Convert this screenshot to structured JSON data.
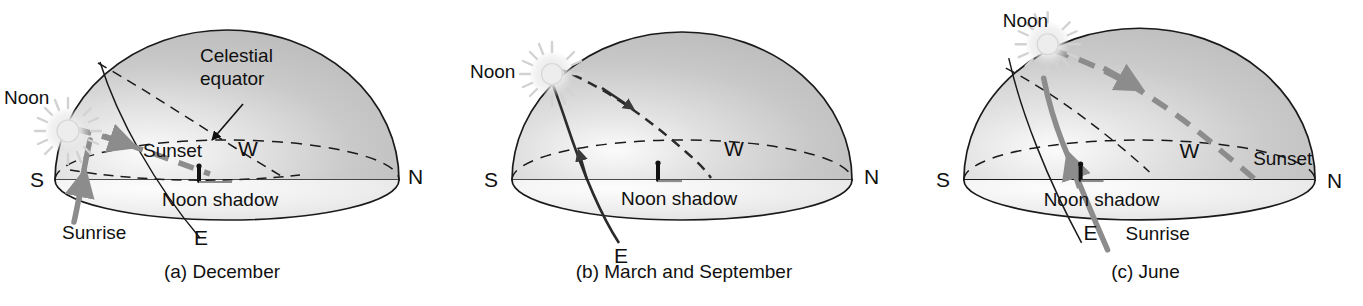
{
  "figure": {
    "colors": {
      "dome_fill_dark": "#c2c2c2",
      "dome_fill_light": "#f2f2f2",
      "outline": "#1a1a1a",
      "sun_path_gray": "#8c8c8c",
      "sun_glow": "#e8e8e8",
      "text": "#101010"
    }
  },
  "panels": [
    {
      "id": "december",
      "caption": "(a) December",
      "cardinals": {
        "south": "S",
        "north": "N",
        "east": "E",
        "west": "W"
      },
      "labels": {
        "noon": "Noon",
        "sunrise": "Sunrise",
        "sunset": "Sunset",
        "celestial_equator": "Celestial\nequator",
        "celestial_equator_line1": "Celestial",
        "celestial_equator_line2": "equator",
        "noon_shadow": "Noon shadow"
      },
      "has_celestial_equator_callout": true,
      "has_sunrise_label": true,
      "has_sunset_label": true,
      "noon_altitude_description": "low"
    },
    {
      "id": "march-september",
      "caption": "(b) March and September",
      "cardinals": {
        "south": "S",
        "north": "N",
        "east": "E",
        "west": "W"
      },
      "labels": {
        "noon": "Noon",
        "noon_shadow": "Noon shadow"
      },
      "has_celestial_equator_callout": false,
      "has_sunrise_label": false,
      "has_sunset_label": false,
      "noon_altitude_description": "medium"
    },
    {
      "id": "june",
      "caption": "(c) June",
      "cardinals": {
        "south": "S",
        "north": "N",
        "east": "E",
        "west": "W"
      },
      "labels": {
        "noon": "Noon",
        "sunrise": "Sunrise",
        "sunset": "Sunset",
        "noon_shadow": "Noon shadow"
      },
      "has_celestial_equator_callout": false,
      "has_sunrise_label": true,
      "has_sunset_label": true,
      "noon_altitude_description": "high"
    }
  ]
}
